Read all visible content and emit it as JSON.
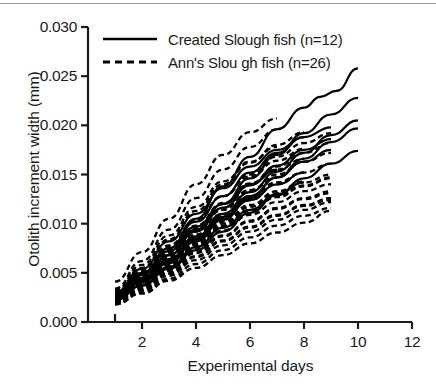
{
  "chart_data": {
    "type": "line",
    "title": "",
    "xlabel": "Experimental days",
    "ylabel": "Otolith increment width (mm)",
    "xlim": [
      0,
      12
    ],
    "ylim": [
      0.0,
      0.03
    ],
    "xticks": [
      "2",
      "4",
      "6",
      "8",
      "10",
      "12"
    ],
    "xtick_values": [
      2,
      4,
      6,
      8,
      10,
      12
    ],
    "yticks": [
      "0.000",
      "0.005",
      "0.010",
      "0.015",
      "0.020",
      "0.025",
      "0.030"
    ],
    "ytick_values": [
      0.0,
      0.005,
      0.01,
      0.015,
      0.02,
      0.025,
      0.03
    ],
    "grid": false,
    "legend_position": "top-left",
    "legend": [
      {
        "label": "Created Slough fish (n=12)",
        "style": "solid",
        "color": "#000000"
      },
      {
        "label": "Ann's  Slou gh fish  (n=26)",
        "style": "dashed",
        "color": "#000000"
      }
    ],
    "series": [
      {
        "name": "Created Slough fish",
        "style": "solid",
        "x": [
          1,
          2,
          3,
          4,
          5,
          6,
          7,
          8,
          8.6,
          9.2,
          10
        ],
        "y": [
          0.0028,
          0.0048,
          0.0075,
          0.0105,
          0.0138,
          0.0168,
          0.0196,
          0.0218,
          0.0229,
          0.0235,
          0.0258
        ]
      },
      {
        "name": "Created Slough fish",
        "style": "solid",
        "x": [
          1,
          2,
          3,
          4,
          5,
          6,
          7,
          8,
          9,
          10
        ],
        "y": [
          0.0026,
          0.0044,
          0.0068,
          0.0094,
          0.012,
          0.0146,
          0.017,
          0.0192,
          0.0211,
          0.0228
        ]
      },
      {
        "name": "Created Slough fish",
        "style": "solid",
        "x": [
          1,
          2,
          3,
          4,
          5,
          6,
          7,
          8,
          9,
          10
        ],
        "y": [
          0.0027,
          0.0044,
          0.0064,
          0.0087,
          0.011,
          0.0132,
          0.0153,
          0.0172,
          0.019,
          0.0205
        ]
      },
      {
        "name": "Created Slough fish",
        "style": "solid",
        "x": [
          1,
          2,
          3,
          4,
          5,
          6,
          7,
          8,
          9,
          10
        ],
        "y": [
          0.0024,
          0.004,
          0.006,
          0.0082,
          0.0104,
          0.0126,
          0.0147,
          0.0166,
          0.0183,
          0.0197
        ]
      },
      {
        "name": "Created Slough fish",
        "style": "solid",
        "x": [
          1,
          2,
          3,
          4,
          5,
          6,
          7,
          8,
          9,
          10
        ],
        "y": [
          0.0023,
          0.0037,
          0.0054,
          0.0073,
          0.0092,
          0.0111,
          0.0129,
          0.0146,
          0.0161,
          0.0174
        ]
      },
      {
        "name": "Created Slough fish",
        "style": "solid",
        "x": [
          1,
          2,
          3,
          4,
          5,
          6,
          7,
          8,
          9
        ],
        "y": [
          0.0029,
          0.005,
          0.0075,
          0.0102,
          0.0128,
          0.0152,
          0.0172,
          0.0188,
          0.0198
        ]
      },
      {
        "name": "Created Slough fish",
        "style": "solid",
        "x": [
          1,
          2,
          3,
          4,
          5,
          6,
          7,
          8,
          9
        ],
        "y": [
          0.0026,
          0.0045,
          0.0068,
          0.0092,
          0.0116,
          0.0139,
          0.0159,
          0.0175,
          0.0186
        ]
      },
      {
        "name": "Created Slough fish",
        "style": "solid",
        "x": [
          1,
          2,
          3,
          4,
          5,
          6,
          7,
          8,
          9
        ],
        "y": [
          0.0025,
          0.0042,
          0.0063,
          0.0085,
          0.0107,
          0.0128,
          0.0147,
          0.0163,
          0.0175
        ]
      },
      {
        "name": "Created Slough fish",
        "style": "solid",
        "x": [
          1,
          2,
          3,
          4,
          5,
          6,
          7,
          8
        ],
        "y": [
          0.003,
          0.0054,
          0.0082,
          0.011,
          0.0136,
          0.0158,
          0.0175,
          0.0188
        ]
      },
      {
        "name": "Created Slough fish",
        "style": "solid",
        "x": [
          1,
          2,
          3,
          4,
          5,
          6,
          7,
          8
        ],
        "y": [
          0.0024,
          0.0041,
          0.0062,
          0.0084,
          0.0105,
          0.0124,
          0.014,
          0.0152
        ]
      },
      {
        "name": "Created Slough fish",
        "style": "solid",
        "x": [
          1,
          2,
          3,
          4,
          5,
          6,
          7,
          8
        ],
        "y": [
          0.0022,
          0.0037,
          0.0056,
          0.0076,
          0.0096,
          0.0114,
          0.013,
          0.0142
        ]
      },
      {
        "name": "Created Slough fish",
        "style": "solid",
        "x": [
          1,
          2,
          3,
          4,
          5,
          6,
          7
        ],
        "y": [
          0.0027,
          0.0048,
          0.0072,
          0.0097,
          0.012,
          0.014,
          0.0155
        ]
      },
      {
        "name": "Ann's Slough fish",
        "style": "dashed",
        "x": [
          1,
          2,
          3,
          4,
          5,
          6,
          7
        ],
        "y": [
          0.0041,
          0.0071,
          0.0105,
          0.014,
          0.017,
          0.0193,
          0.0207
        ]
      },
      {
        "name": "Ann's Slough fish",
        "style": "dashed",
        "x": [
          1,
          2,
          3,
          4,
          5,
          6,
          7
        ],
        "y": [
          0.0034,
          0.0062,
          0.0094,
          0.0126,
          0.0155,
          0.0178,
          0.0196
        ]
      },
      {
        "name": "Ann's Slough fish",
        "style": "dashed",
        "x": [
          1,
          2,
          3,
          4,
          5,
          6,
          7,
          8
        ],
        "y": [
          0.003,
          0.0055,
          0.0084,
          0.0113,
          0.014,
          0.0162,
          0.018,
          0.0193
        ]
      },
      {
        "name": "Ann's Slough fish",
        "style": "dashed",
        "x": [
          1,
          2,
          3,
          4,
          5,
          6,
          7,
          8,
          9
        ],
        "y": [
          0.0028,
          0.005,
          0.0076,
          0.0103,
          0.0128,
          0.015,
          0.0168,
          0.0182,
          0.0192
        ]
      },
      {
        "name": "Ann's Slough fish",
        "style": "dashed",
        "x": [
          1,
          2,
          3,
          4,
          5,
          6,
          7,
          8,
          9
        ],
        "y": [
          0.0026,
          0.0047,
          0.0071,
          0.0096,
          0.012,
          0.0141,
          0.0158,
          0.0172,
          0.0182
        ]
      },
      {
        "name": "Ann's Slough fish",
        "style": "dashed",
        "x": [
          1,
          2,
          3,
          4,
          5,
          6,
          7,
          8,
          9
        ],
        "y": [
          0.0025,
          0.0045,
          0.0068,
          0.0092,
          0.0114,
          0.0134,
          0.015,
          0.0163,
          0.0172
        ]
      },
      {
        "name": "Ann's Slough fish",
        "style": "dashed",
        "x": [
          1,
          2,
          3,
          4,
          5,
          6,
          7,
          8,
          9
        ],
        "y": [
          0.0024,
          0.0042,
          0.0063,
          0.0085,
          0.0106,
          0.0124,
          0.014,
          0.0152,
          0.0161
        ]
      },
      {
        "name": "Ann's Slough fish",
        "style": "dashed",
        "x": [
          1,
          2,
          3,
          4,
          5,
          6,
          7,
          8,
          9
        ],
        "y": [
          0.0023,
          0.004,
          0.006,
          0.008,
          0.01,
          0.0117,
          0.0131,
          0.0142,
          0.015
        ]
      },
      {
        "name": "Ann's Slough fish",
        "style": "dashed",
        "x": [
          1,
          2,
          3,
          4,
          5,
          6,
          7,
          8,
          9
        ],
        "y": [
          0.0022,
          0.0038,
          0.0056,
          0.0075,
          0.0093,
          0.0109,
          0.0122,
          0.0133,
          0.014
        ]
      },
      {
        "name": "Ann's Slough fish",
        "style": "dashed",
        "x": [
          1,
          2,
          3,
          4,
          5,
          6,
          7,
          8,
          9
        ],
        "y": [
          0.0021,
          0.0036,
          0.0053,
          0.0071,
          0.0088,
          0.0103,
          0.0116,
          0.0126,
          0.0133
        ]
      },
      {
        "name": "Ann's Slough fish",
        "style": "dashed",
        "x": [
          1,
          2,
          3,
          4,
          5,
          6,
          7,
          8,
          9
        ],
        "y": [
          0.002,
          0.0034,
          0.005,
          0.0067,
          0.0083,
          0.0097,
          0.0109,
          0.0119,
          0.0126
        ]
      },
      {
        "name": "Ann's Slough fish",
        "style": "dashed",
        "x": [
          1,
          2,
          3,
          4,
          5,
          6,
          7,
          8,
          9
        ],
        "y": [
          0.0019,
          0.0032,
          0.0047,
          0.0063,
          0.0078,
          0.0092,
          0.0104,
          0.0114,
          0.0122
        ]
      },
      {
        "name": "Ann's Slough fish",
        "style": "dashed",
        "x": [
          1,
          2,
          3,
          4,
          5,
          6,
          7,
          8,
          9
        ],
        "y": [
          0.0018,
          0.003,
          0.0044,
          0.0059,
          0.0073,
          0.0086,
          0.0098,
          0.0108,
          0.0116
        ]
      },
      {
        "name": "Ann's Slough fish",
        "style": "dashed",
        "x": [
          1,
          2,
          3,
          4,
          5,
          6,
          7,
          8,
          9
        ],
        "y": [
          0.0018,
          0.0029,
          0.0042,
          0.0055,
          0.0068,
          0.008,
          0.0091,
          0.0101,
          0.0113
        ]
      },
      {
        "name": "Ann's Slough fish",
        "style": "dashed",
        "x": [
          1,
          2,
          3,
          4,
          5,
          6,
          7,
          8
        ],
        "y": [
          0.0029,
          0.0052,
          0.0078,
          0.0104,
          0.0128,
          0.0148,
          0.0164,
          0.0176
        ]
      },
      {
        "name": "Ann's Slough fish",
        "style": "dashed",
        "x": [
          1,
          2,
          3,
          4,
          5,
          6,
          7,
          8
        ],
        "y": [
          0.0027,
          0.0048,
          0.0073,
          0.0098,
          0.0121,
          0.014,
          0.0155,
          0.0166
        ]
      },
      {
        "name": "Ann's Slough fish",
        "style": "dashed",
        "x": [
          1,
          2,
          3,
          4,
          5,
          6,
          7,
          8
        ],
        "y": [
          0.0025,
          0.0044,
          0.0066,
          0.0089,
          0.011,
          0.0128,
          0.0142,
          0.0152
        ]
      },
      {
        "name": "Ann's Slough fish",
        "style": "dashed",
        "x": [
          1,
          2,
          3,
          4,
          5,
          6,
          7,
          8
        ],
        "y": [
          0.0023,
          0.0041,
          0.0061,
          0.0082,
          0.0102,
          0.0119,
          0.0133,
          0.0143
        ]
      },
      {
        "name": "Ann's Slough fish",
        "style": "dashed",
        "x": [
          1,
          2,
          3,
          4,
          5,
          6,
          7
        ],
        "y": [
          0.0032,
          0.0058,
          0.0088,
          0.0117,
          0.0143,
          0.0163,
          0.0178
        ]
      },
      {
        "name": "Ann's Slough fish",
        "style": "dashed",
        "x": [
          1,
          2,
          3,
          4,
          5,
          6,
          7
        ],
        "y": [
          0.0026,
          0.0046,
          0.007,
          0.0094,
          0.0116,
          0.0134,
          0.0147
        ]
      },
      {
        "name": "Ann's Slough fish",
        "style": "dashed",
        "x": [
          1,
          2,
          3,
          4,
          5,
          6
        ],
        "y": [
          0.0024,
          0.0043,
          0.0065,
          0.0088,
          0.0109,
          0.0126
        ]
      },
      {
        "name": "Ann's Slough fish",
        "style": "dashed",
        "x": [
          1,
          2,
          3,
          4,
          5,
          6
        ],
        "y": [
          0.0022,
          0.0039,
          0.0059,
          0.0079,
          0.0098,
          0.0114
        ]
      },
      {
        "name": "Ann's Slough fish",
        "style": "dashed",
        "x": [
          1,
          2,
          3,
          4,
          5,
          6,
          7,
          8,
          9
        ],
        "y": [
          0.0021,
          0.0037,
          0.0057,
          0.0077,
          0.0096,
          0.0113,
          0.0127,
          0.0138,
          0.0146
        ]
      },
      {
        "name": "Ann's Slough fish",
        "style": "dashed",
        "x": [
          1,
          2,
          3,
          4,
          5,
          6,
          7,
          8,
          9
        ],
        "y": [
          0.002,
          0.0035,
          0.0052,
          0.007,
          0.0087,
          0.0102,
          0.0115,
          0.0125,
          0.0131
        ]
      },
      {
        "name": "Ann's Slough fish",
        "style": "dashed",
        "x": [
          1,
          2,
          3,
          4,
          5,
          6,
          7,
          8,
          9
        ],
        "y": [
          0.0019,
          0.0033,
          0.0049,
          0.0066,
          0.0082,
          0.0096,
          0.0108,
          0.0118,
          0.0124
        ]
      },
      {
        "name": "Ann's Slough fish",
        "style": "dashed",
        "x": [
          1,
          2,
          3,
          4,
          5,
          6,
          7,
          8,
          9
        ],
        "y": [
          0.0022,
          0.0039,
          0.0058,
          0.0078,
          0.0097,
          0.0114,
          0.0128,
          0.0139,
          0.0147
        ]
      }
    ]
  },
  "axes": {
    "y_label": "Otolith increment width (mm)",
    "x_label": "Experimental days"
  },
  "colors": {
    "line": "#000000",
    "axis": "#1a1a1a",
    "text": "#1a1a1a",
    "background": "#ffffff",
    "top_rule": "#9a9a9a"
  }
}
